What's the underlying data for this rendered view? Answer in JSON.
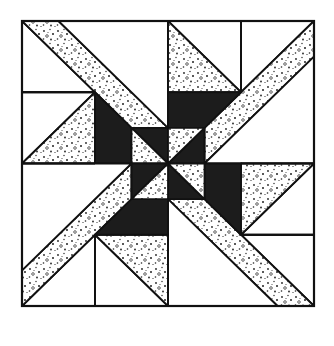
{
  "diagram": {
    "colors": {
      "background": "#ffffff",
      "outline": "#111111",
      "dark": "#1c1c1c",
      "speckle_bg": "#ffffff",
      "speckle_dot": "#222222",
      "white": "#ffffff"
    },
    "pattern": {
      "type": "4-fold rotational pinwheel block",
      "grid_units": 8,
      "fabrics": [
        "white",
        "speckled",
        "dark"
      ],
      "quadrant_pieces": [
        {
          "fabric": "white",
          "shape": "triangle"
        },
        {
          "fabric": "speckled",
          "shape": "diagonal-band"
        },
        {
          "fabric": "white",
          "shape": "rectangle"
        },
        {
          "fabric": "speckled",
          "shape": "triangle"
        },
        {
          "fabric": "dark",
          "shape": "trapezoid"
        },
        {
          "fabric": "dark",
          "shape": "triangle"
        },
        {
          "fabric": "speckled",
          "shape": "triangle"
        }
      ]
    }
  }
}
